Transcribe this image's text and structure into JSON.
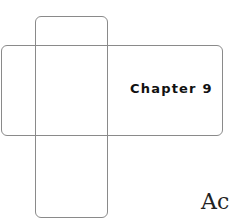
{
  "page": {
    "chapter_label": "Chapter 9",
    "title_fragment": "Ac"
  }
}
